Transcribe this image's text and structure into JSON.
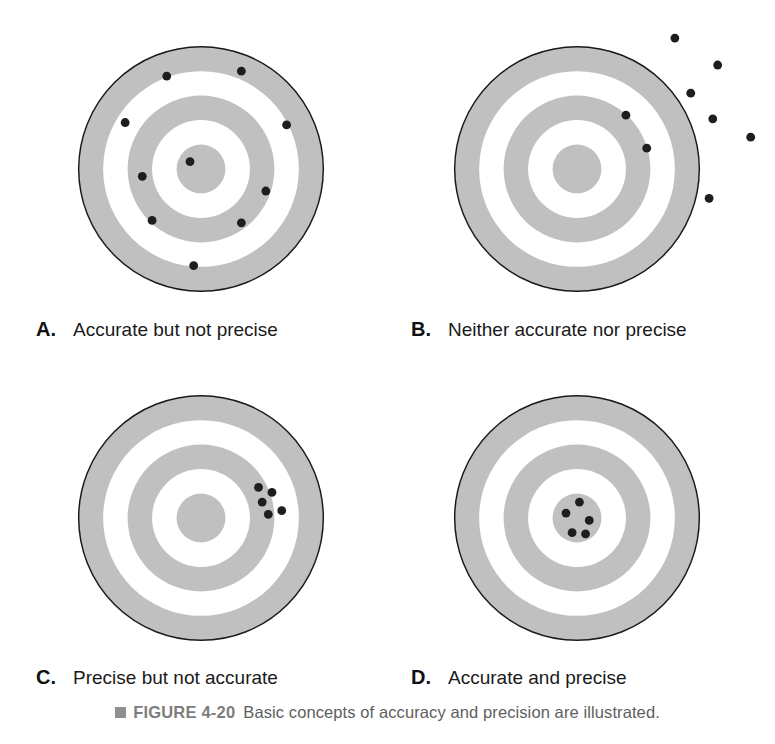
{
  "figure": {
    "bullet_icon": "square-bullet-icon",
    "label": "FIGURE 4-20",
    "caption": "Basic concepts of accuracy and precision are illustrated.",
    "label_color": "#7d7d7d",
    "caption_color": "#5e5e5e",
    "bullet_color": "#8f8f8f"
  },
  "style": {
    "ring_gray": "#c0c0c0",
    "ring_white": "#ffffff",
    "outline": "#1a1a1a",
    "dot_color": "#1e1e1e",
    "background": "#ffffff"
  },
  "chart_data": {
    "type": "scatter",
    "title": "Basic concepts of accuracy and precision are illustrated.",
    "xlabel": "",
    "ylabel": "",
    "xlim": [
      -1.35,
      1.35
    ],
    "ylim": [
      -1.35,
      1.35
    ],
    "grid": false,
    "legend": "none",
    "target_rings": [
      {
        "name": "outer-gray-ring",
        "outer_r": 1.0,
        "inner_r": 0.8,
        "fill": "#c0c0c0"
      },
      {
        "name": "outer-white-ring",
        "outer_r": 0.8,
        "inner_r": 0.6,
        "fill": "#ffffff"
      },
      {
        "name": "middle-gray-ring",
        "outer_r": 0.6,
        "inner_r": 0.4,
        "fill": "#c0c0c0"
      },
      {
        "name": "inner-white-ring",
        "outer_r": 0.4,
        "inner_r": 0.2,
        "fill": "#ffffff"
      },
      {
        "name": "bullseye-center",
        "outer_r": 0.2,
        "inner_r": 0.0,
        "fill": "#c0c0c0"
      }
    ],
    "panels": [
      {
        "id": "A",
        "letter": "A.",
        "label": "Accurate but not precise",
        "n_points": 9,
        "points": [
          {
            "x": -0.28,
            "y": 0.76
          },
          {
            "x": 0.33,
            "y": 0.8
          },
          {
            "x": -0.62,
            "y": 0.38
          },
          {
            "x": 0.7,
            "y": 0.36
          },
          {
            "x": -0.09,
            "y": 0.06
          },
          {
            "x": -0.48,
            "y": -0.06
          },
          {
            "x": 0.53,
            "y": -0.18
          },
          {
            "x": -0.4,
            "y": -0.42
          },
          {
            "x": 0.33,
            "y": -0.44
          },
          {
            "x": -0.06,
            "y": -0.79
          }
        ]
      },
      {
        "id": "B",
        "letter": "B.",
        "label": "Neither accurate nor precise",
        "n_points": 6,
        "points": [
          {
            "x": 0.8,
            "y": 1.07
          },
          {
            "x": 1.15,
            "y": 0.85
          },
          {
            "x": 0.93,
            "y": 0.62
          },
          {
            "x": 1.11,
            "y": 0.41
          },
          {
            "x": 0.4,
            "y": 0.44
          },
          {
            "x": 1.42,
            "y": 0.26
          },
          {
            "x": 0.57,
            "y": 0.17
          },
          {
            "x": 1.08,
            "y": -0.24
          }
        ]
      },
      {
        "id": "C",
        "letter": "C.",
        "label": "Precise but not accurate",
        "n_points": 5,
        "points": [
          {
            "x": 0.47,
            "y": 0.25
          },
          {
            "x": 0.58,
            "y": 0.21
          },
          {
            "x": 0.5,
            "y": 0.13
          },
          {
            "x": 0.66,
            "y": 0.06
          },
          {
            "x": 0.55,
            "y": 0.03
          }
        ]
      },
      {
        "id": "D",
        "letter": "D.",
        "label": "Accurate and precise",
        "n_points": 5,
        "points": [
          {
            "x": 0.02,
            "y": 0.13
          },
          {
            "x": -0.09,
            "y": 0.04
          },
          {
            "x": 0.1,
            "y": -0.02
          },
          {
            "x": -0.04,
            "y": -0.12
          },
          {
            "x": 0.07,
            "y": -0.13
          }
        ]
      }
    ]
  },
  "panels": {
    "a": {
      "letter": "A.",
      "label": "Accurate but not precise"
    },
    "b": {
      "letter": "B.",
      "label": "Neither accurate nor precise"
    },
    "c": {
      "letter": "C.",
      "label": "Precise but not accurate"
    },
    "d": {
      "letter": "D.",
      "label": "Accurate and precise"
    }
  }
}
